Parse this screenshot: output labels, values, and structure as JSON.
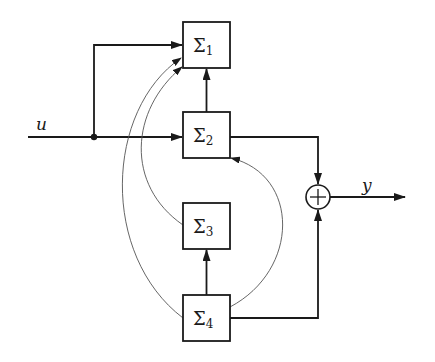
{
  "diagram": {
    "type": "block-diagram",
    "input_signal": "u",
    "output_signal": "y",
    "blocks": [
      {
        "id": "S1",
        "symbol": "Σ",
        "subscript": "1"
      },
      {
        "id": "S2",
        "symbol": "Σ",
        "subscript": "2"
      },
      {
        "id": "S3",
        "symbol": "Σ",
        "subscript": "3"
      },
      {
        "id": "S4",
        "symbol": "Σ",
        "subscript": "4"
      }
    ],
    "summing_junction": {
      "symbol": "+"
    },
    "connections": [
      {
        "from": "u",
        "to": "S1",
        "style": "thick"
      },
      {
        "from": "u",
        "to": "S2",
        "style": "thick"
      },
      {
        "from": "S2",
        "to": "S1",
        "style": "thick"
      },
      {
        "from": "S4",
        "to": "S3",
        "style": "thick"
      },
      {
        "from": "S2",
        "to": "sum",
        "style": "thick"
      },
      {
        "from": "S4",
        "to": "sum",
        "style": "thick"
      },
      {
        "from": "sum",
        "to": "y",
        "style": "thick"
      },
      {
        "from": "S3",
        "to": "S1",
        "style": "thin-curve"
      },
      {
        "from": "S4",
        "to": "S1",
        "style": "thin-curve"
      },
      {
        "from": "S4",
        "to": "S2",
        "style": "thin-curve"
      }
    ]
  }
}
